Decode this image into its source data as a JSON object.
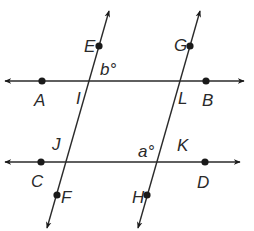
{
  "diagram": {
    "colors": {
      "line": "#2a2a2a",
      "point": "#1a1a1a",
      "background": "#ffffff"
    },
    "lines": [
      {
        "id": "AB",
        "x1": 5,
        "y1": 81,
        "x2": 244,
        "y2": 81,
        "arrows": "both"
      },
      {
        "id": "CD",
        "x1": 5,
        "y1": 162,
        "x2": 240,
        "y2": 162,
        "arrows": "both"
      },
      {
        "id": "EF",
        "x1": 109,
        "y1": 11,
        "x2": 47,
        "y2": 228,
        "arrows": "both"
      },
      {
        "id": "GH",
        "x1": 200,
        "y1": 11,
        "x2": 138,
        "y2": 228,
        "arrows": "both"
      }
    ],
    "points": [
      {
        "name": "A",
        "x": 42,
        "y": 81
      },
      {
        "name": "B",
        "x": 206,
        "y": 81
      },
      {
        "name": "C",
        "x": 41,
        "y": 162
      },
      {
        "name": "D",
        "x": 205,
        "y": 162
      },
      {
        "name": "E",
        "x": 99,
        "y": 46
      },
      {
        "name": "G",
        "x": 190,
        "y": 46
      },
      {
        "name": "F",
        "x": 57,
        "y": 195
      },
      {
        "name": "H",
        "x": 147,
        "y": 195
      }
    ],
    "labels": [
      {
        "text": "A",
        "x": 34,
        "y": 106
      },
      {
        "text": "B",
        "x": 202,
        "y": 106
      },
      {
        "text": "C",
        "x": 31,
        "y": 187
      },
      {
        "text": "D",
        "x": 197,
        "y": 188
      },
      {
        "text": "E",
        "x": 84,
        "y": 52
      },
      {
        "text": "G",
        "x": 174,
        "y": 51
      },
      {
        "text": "F",
        "x": 61,
        "y": 203
      },
      {
        "text": "H",
        "x": 132,
        "y": 203
      },
      {
        "text": "I",
        "x": 76,
        "y": 104
      },
      {
        "text": "L",
        "x": 178,
        "y": 104
      },
      {
        "text": "J",
        "x": 52,
        "y": 150
      },
      {
        "text": "K",
        "x": 177,
        "y": 151
      }
    ],
    "angles": [
      {
        "text": "b°",
        "x": 100,
        "y": 75
      },
      {
        "text": "a°",
        "x": 138,
        "y": 157
      }
    ]
  }
}
